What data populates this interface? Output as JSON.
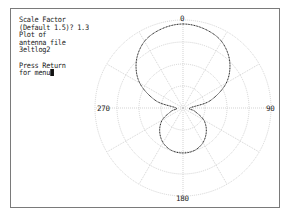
{
  "console": {
    "lines": [
      "Scale Factor",
      "(Default 1.5)? 1.3",
      "Plot of",
      "antenna file",
      "3eltlog2",
      "",
      "Press Return",
      "for menu"
    ],
    "cursor": "block"
  },
  "plot": {
    "type": "polar",
    "center": [
      183,
      108
    ],
    "ring_radii": [
      22,
      44,
      66,
      88
    ],
    "spoke_angles_deg": [
      0,
      30,
      60,
      90,
      120,
      150,
      180,
      210,
      240,
      270,
      300,
      330
    ],
    "grid_color": "#c8c8c8",
    "trace_color": "#1a1a1a",
    "labels": {
      "top": "0",
      "right": "90",
      "bottom": "180",
      "left": "270"
    }
  },
  "chart_data": {
    "type": "polar",
    "title": "Plot of antenna file 3eltlog2",
    "scale_factor": 1.3,
    "angle_labels": [
      "0",
      "90",
      "180",
      "270"
    ],
    "series": [
      {
        "name": "3eltlog2 radiation pattern",
        "angles_deg": [
          0,
          15,
          30,
          45,
          60,
          75,
          90,
          105,
          120,
          135,
          150,
          165,
          180,
          195,
          210,
          225,
          240,
          255,
          270,
          285,
          300,
          315,
          330,
          345
        ],
        "radius_px": [
          84,
          82,
          77,
          66,
          50,
          28,
          7,
          12,
          24,
          33,
          40,
          44,
          45,
          44,
          40,
          33,
          24,
          12,
          7,
          28,
          50,
          66,
          77,
          82
        ]
      }
    ]
  }
}
